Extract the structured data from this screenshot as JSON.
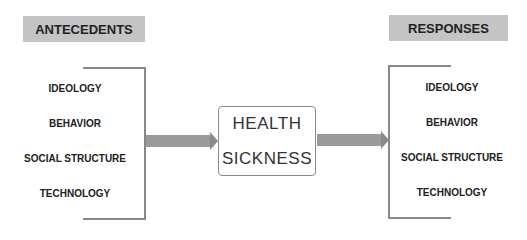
{
  "antecedents": {
    "title": "ANTECEDENTS",
    "items": [
      "IDEOLOGY",
      "BEHAVIOR",
      "SOCIAL STRUCTURE",
      "TECHNOLOGY"
    ]
  },
  "center": {
    "line1": "HEALTH",
    "line2": "SICKNESS"
  },
  "responses": {
    "title": "RESPONSES",
    "items": [
      "IDEOLOGY",
      "BEHAVIOR",
      "SOCIAL STRUCTURE",
      "TECHNOLOGY"
    ]
  },
  "colors": {
    "header_bg": "#c4c4c4",
    "line": "#888888",
    "arrow": "#9a9a9a"
  }
}
